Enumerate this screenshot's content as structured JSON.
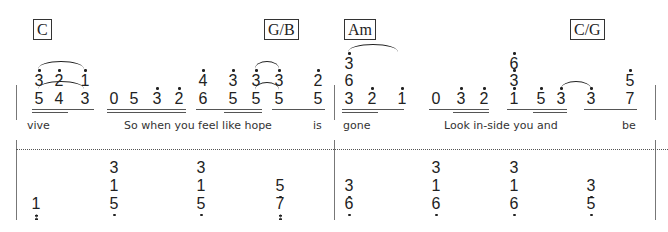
{
  "chords": [
    {
      "label": "C",
      "x": 33,
      "y": 19
    },
    {
      "label": "G/B",
      "x": 264,
      "y": 19
    },
    {
      "label": "Am",
      "x": 344,
      "y": 19
    },
    {
      "label": "C/G",
      "x": 570,
      "y": 19
    }
  ],
  "upper_staff": {
    "measures": [
      {
        "notes": [
          {
            "id": "m1-n1-top",
            "digit": "3",
            "x": 33,
            "row": "top",
            "dot": "up"
          },
          {
            "id": "m1-n2-top",
            "digit": "2",
            "x": 53,
            "row": "top",
            "dot": "up"
          },
          {
            "id": "m1-n3-top",
            "digit": "1",
            "x": 79,
            "row": "top",
            "dot": "up"
          },
          {
            "id": "m1-n1-bot",
            "digit": "5",
            "x": 33,
            "row": "bottom",
            "dot": "none"
          },
          {
            "id": "m1-n2-bot",
            "digit": "4",
            "x": 53,
            "row": "bottom",
            "dot": "none"
          },
          {
            "id": "m1-n3-bot",
            "digit": "3",
            "x": 79,
            "row": "bottom",
            "dot": "none"
          },
          {
            "id": "m1-n4",
            "digit": "0",
            "x": 108,
            "row": "bottom",
            "dot": "none"
          },
          {
            "id": "m1-n5",
            "digit": "5",
            "x": 128,
            "row": "bottom",
            "dot": "none"
          },
          {
            "id": "m1-n6",
            "digit": "3",
            "x": 151,
            "row": "bottom",
            "dot": "up"
          },
          {
            "id": "m1-n7",
            "digit": "2",
            "x": 173,
            "row": "bottom",
            "dot": "up"
          },
          {
            "id": "m1-n8-top",
            "digit": "4",
            "x": 197,
            "row": "top",
            "dot": "up"
          },
          {
            "id": "m1-n8-bot",
            "digit": "6",
            "x": 197,
            "row": "bottom",
            "dot": "none"
          },
          {
            "id": "m1-n9-top",
            "digit": "3",
            "x": 227,
            "row": "top",
            "dot": "up"
          },
          {
            "id": "m1-n9-bot",
            "digit": "5",
            "x": 227,
            "row": "bottom",
            "dot": "none"
          },
          {
            "id": "m1-n10-top",
            "digit": "3",
            "x": 250,
            "row": "top",
            "dot": "up"
          },
          {
            "id": "m1-n10-bot",
            "digit": "5",
            "x": 250,
            "row": "bottom",
            "dot": "none"
          },
          {
            "id": "m1-n11-top",
            "digit": "3",
            "x": 273,
            "row": "top",
            "dot": "up"
          },
          {
            "id": "m1-n11-bot",
            "digit": "5",
            "x": 273,
            "row": "bottom",
            "dot": "none"
          },
          {
            "id": "m1-n12-top",
            "digit": "2",
            "x": 312,
            "row": "top",
            "dot": "up"
          },
          {
            "id": "m1-n12-bot",
            "digit": "5",
            "x": 312,
            "row": "bottom",
            "dot": "none"
          }
        ],
        "underlines": [
          {
            "x": 32,
            "w": 62,
            "level": 1
          },
          {
            "x": 32,
            "w": 36,
            "level": 2
          },
          {
            "x": 107,
            "w": 79,
            "level": 1
          },
          {
            "x": 107,
            "w": 79,
            "level": 2
          },
          {
            "x": 196,
            "w": 66,
            "level": 1
          },
          {
            "x": 224,
            "w": 38,
            "level": 2
          },
          {
            "x": 272,
            "w": 53,
            "level": 1
          }
        ],
        "slurs": [
          {
            "x": 38,
            "y": 61,
            "w": 46
          },
          {
            "x": 38,
            "y": 81,
            "w": 46
          },
          {
            "x": 255,
            "y": 61,
            "w": 24
          },
          {
            "x": 255,
            "y": 82,
            "w": 24
          }
        ]
      },
      {
        "notes": [
          {
            "id": "m2-n1-top",
            "digit": "3",
            "x": 343,
            "row": "top2",
            "dot": "up"
          },
          {
            "id": "m2-n1-mid",
            "digit": "6",
            "x": 343,
            "row": "top",
            "dot": "none"
          },
          {
            "id": "m2-n1-bot",
            "digit": "3",
            "x": 343,
            "row": "bottom",
            "dot": "none"
          },
          {
            "id": "m2-n2",
            "digit": "2",
            "x": 366,
            "row": "bottom",
            "dot": "up"
          },
          {
            "id": "m2-n3",
            "digit": "1",
            "x": 396,
            "row": "bottom",
            "dot": "up"
          },
          {
            "id": "m2-n4",
            "digit": "0",
            "x": 430,
            "row": "bottom",
            "dot": "none"
          },
          {
            "id": "m2-n5",
            "digit": "3",
            "x": 455,
            "row": "bottom",
            "dot": "up"
          },
          {
            "id": "m2-n6",
            "digit": "2",
            "x": 478,
            "row": "bottom",
            "dot": "up"
          },
          {
            "id": "m2-n7-top",
            "digit": "6",
            "x": 508,
            "row": "top2",
            "dot": "up"
          },
          {
            "id": "m2-n7-mid",
            "digit": "3",
            "x": 508,
            "row": "top",
            "dot": "up"
          },
          {
            "id": "m2-n7-bot",
            "digit": "1",
            "x": 508,
            "row": "bottom",
            "dot": "up"
          },
          {
            "id": "m2-n8",
            "digit": "5",
            "x": 535,
            "row": "bottom",
            "dot": "up"
          },
          {
            "id": "m2-n9",
            "digit": "3",
            "x": 555,
            "row": "bottom",
            "dot": "up"
          },
          {
            "id": "m2-n10",
            "digit": "3",
            "x": 585,
            "row": "bottom",
            "dot": "up"
          },
          {
            "id": "m2-n11-top",
            "digit": "5",
            "x": 624,
            "row": "top",
            "dot": "up"
          },
          {
            "id": "m2-n11-bot",
            "digit": "7",
            "x": 624,
            "row": "bottom",
            "dot": "none"
          }
        ],
        "underlines": [
          {
            "x": 342,
            "w": 62,
            "level": 1
          },
          {
            "x": 342,
            "w": 36,
            "level": 2
          },
          {
            "x": 429,
            "w": 60,
            "level": 1
          },
          {
            "x": 453,
            "w": 36,
            "level": 2
          },
          {
            "x": 507,
            "w": 60,
            "level": 1
          },
          {
            "x": 533,
            "w": 34,
            "level": 2
          },
          {
            "x": 584,
            "w": 53,
            "level": 1
          }
        ],
        "slurs": [
          {
            "x": 348,
            "y": 44,
            "w": 50
          },
          {
            "x": 561,
            "y": 81,
            "w": 30
          }
        ]
      }
    ]
  },
  "lyrics": [
    {
      "text": "vive",
      "x": 27
    },
    {
      "text": "So when you feel like hope",
      "x": 124
    },
    {
      "text": "is",
      "x": 313
    },
    {
      "text": "gone",
      "x": 343
    },
    {
      "text": "Look in-side you and",
      "x": 444
    },
    {
      "text": "be",
      "x": 622
    }
  ],
  "lower_staff": {
    "notes": [
      {
        "id": "l-1-bot",
        "digit": "1",
        "x": 30,
        "row": 3,
        "dot": "down2"
      },
      {
        "id": "l-2-top",
        "digit": "3",
        "x": 108,
        "row": 1,
        "dot": "none"
      },
      {
        "id": "l-2-mid",
        "digit": "1",
        "x": 108,
        "row": 2,
        "dot": "none"
      },
      {
        "id": "l-2-bot",
        "digit": "5",
        "x": 108,
        "row": 3,
        "dot": "down"
      },
      {
        "id": "l-3-top",
        "digit": "3",
        "x": 195,
        "row": 1,
        "dot": "none"
      },
      {
        "id": "l-3-mid",
        "digit": "1",
        "x": 195,
        "row": 2,
        "dot": "none"
      },
      {
        "id": "l-3-bot",
        "digit": "5",
        "x": 195,
        "row": 3,
        "dot": "down"
      },
      {
        "id": "l-4-mid",
        "digit": "5",
        "x": 274,
        "row": 2,
        "dot": "down"
      },
      {
        "id": "l-4-bot",
        "digit": "7",
        "x": 274,
        "row": 3,
        "dot": "down2"
      },
      {
        "id": "l-5-mid",
        "digit": "3",
        "x": 343,
        "row": 2,
        "dot": "down"
      },
      {
        "id": "l-5-bot",
        "digit": "6",
        "x": 343,
        "row": 3,
        "dot": "down"
      },
      {
        "id": "l-6-top",
        "digit": "3",
        "x": 430,
        "row": 1,
        "dot": "none"
      },
      {
        "id": "l-6-mid",
        "digit": "1",
        "x": 430,
        "row": 2,
        "dot": "none"
      },
      {
        "id": "l-6-bot",
        "digit": "6",
        "x": 430,
        "row": 3,
        "dot": "down"
      },
      {
        "id": "l-7-top",
        "digit": "3",
        "x": 508,
        "row": 1,
        "dot": "none"
      },
      {
        "id": "l-7-mid",
        "digit": "1",
        "x": 508,
        "row": 2,
        "dot": "none"
      },
      {
        "id": "l-7-bot",
        "digit": "6",
        "x": 508,
        "row": 3,
        "dot": "down"
      },
      {
        "id": "l-8-mid",
        "digit": "3",
        "x": 585,
        "row": 2,
        "dot": "down"
      },
      {
        "id": "l-8-bot",
        "digit": "5",
        "x": 585,
        "row": 3,
        "dot": "down"
      }
    ]
  },
  "barlines": [
    {
      "x": 16,
      "y": 85,
      "h": 35
    },
    {
      "x": 334,
      "y": 85,
      "h": 35
    },
    {
      "x": 655,
      "y": 85,
      "h": 35
    },
    {
      "x": 16,
      "y": 140,
      "h": 80
    },
    {
      "x": 334,
      "y": 140,
      "h": 80
    },
    {
      "x": 655,
      "y": 140,
      "h": 80
    }
  ],
  "colors": {
    "ink": "#222222",
    "barline": "#777777",
    "background": "#ffffff"
  }
}
